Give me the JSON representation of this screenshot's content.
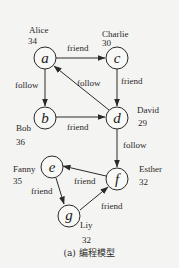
{
  "caption": "(a) 编程模型",
  "colors": {
    "stroke": "#2a2a2a",
    "background": "#f4f4f2"
  },
  "nodes": [
    {
      "id": "a",
      "name": "Alice",
      "age": "34",
      "cx": 45,
      "cy": 58
    },
    {
      "id": "b",
      "name": "Bob",
      "age": "36",
      "cx": 45,
      "cy": 118
    },
    {
      "id": "c",
      "name": "Charlie",
      "age": "30",
      "cx": 117,
      "cy": 58
    },
    {
      "id": "d",
      "name": "David",
      "age": "29",
      "cx": 117,
      "cy": 118
    },
    {
      "id": "e",
      "name": "Fanny",
      "age": "35",
      "cx": 52,
      "cy": 167
    },
    {
      "id": "f",
      "name": "Esther",
      "age": "32",
      "cx": 117,
      "cy": 179
    },
    {
      "id": "g",
      "name": "Liy",
      "age": "32",
      "cx": 69,
      "cy": 216
    }
  ],
  "edges": [
    {
      "from": "a",
      "to": "c",
      "label": "friend"
    },
    {
      "from": "a",
      "to": "b",
      "label": "follow"
    },
    {
      "from": "c",
      "to": "d",
      "label": "friend"
    },
    {
      "from": "d",
      "to": "a",
      "label": "follow"
    },
    {
      "from": "b",
      "to": "d",
      "label": "friend"
    },
    {
      "from": "d",
      "to": "f",
      "label": "follow"
    },
    {
      "from": "f",
      "to": "e",
      "label": "friend"
    },
    {
      "from": "e",
      "to": "g",
      "label": "friend"
    },
    {
      "from": "g",
      "to": "f",
      "label": "friend"
    }
  ]
}
